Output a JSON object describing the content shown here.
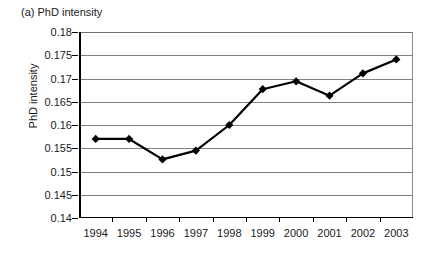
{
  "figure": {
    "panel_caption": "(a) PhD intensity"
  },
  "chart_data": {
    "type": "line",
    "title": "(a) PhD intensity",
    "xlabel": "",
    "ylabel": "PhD intensity",
    "categories": [
      "1994",
      "1995",
      "1996",
      "1997",
      "1998",
      "1999",
      "2000",
      "2001",
      "2002",
      "2003"
    ],
    "values": [
      0.157,
      0.157,
      0.1526,
      0.1545,
      0.16,
      0.1677,
      0.1694,
      0.1663,
      0.1711,
      0.1741
    ],
    "series": [
      {
        "name": "PhD intensity",
        "values": [
          0.157,
          0.157,
          0.1526,
          0.1545,
          0.16,
          0.1677,
          0.1694,
          0.1663,
          0.1711,
          0.1741
        ]
      }
    ],
    "ylim": [
      0.14,
      0.18
    ],
    "ytick_labels": [
      "0.18",
      "0.175",
      "0.17",
      "0.165",
      "0.16",
      "0.155",
      "0.15",
      "0.145",
      "0.14"
    ],
    "ytick_values": [
      0.18,
      0.175,
      0.17,
      0.165,
      0.16,
      0.155,
      0.15,
      0.145,
      0.14
    ],
    "xtick_labels": [
      "1994",
      "1995",
      "1996",
      "1997",
      "1998",
      "1999",
      "2000",
      "2001",
      "2002",
      "2003"
    ],
    "grid": "horizontal",
    "legend": "none",
    "marker": "diamond",
    "line_color": "#000000",
    "marker_color": "#000000",
    "grid_color": "#808080",
    "background_color": "#ffffff"
  }
}
